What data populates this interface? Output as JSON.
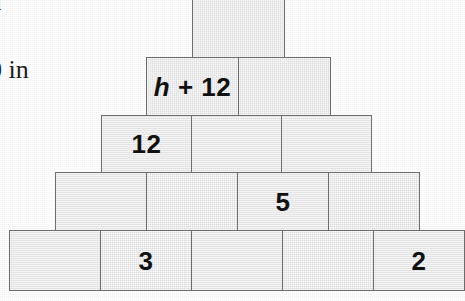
{
  "figure": {
    "type": "block-pyramid-diagram",
    "colors": {
      "block_fill": "#e9e9e9",
      "block_border": "#6f6f6f",
      "label_text": "#111111",
      "page_background": "#ffffff",
      "margin_text": "#1c1c1c"
    },
    "margin_text": {
      "top_fragment": "n",
      "units_fragment": "0 in"
    },
    "rows": [
      {
        "row": 1,
        "block_count": 1,
        "blocks": [
          {
            "index": 1,
            "label": "",
            "label_parts": []
          }
        ]
      },
      {
        "row": 2,
        "block_count": 2,
        "blocks": [
          {
            "index": 1,
            "label": "h + 12",
            "label_parts": [
              {
                "text": "h",
                "style": "italic"
              },
              {
                "text": " + 12",
                "style": "normal"
              }
            ]
          },
          {
            "index": 2,
            "label": "",
            "label_parts": []
          }
        ]
      },
      {
        "row": 3,
        "block_count": 3,
        "blocks": [
          {
            "index": 1,
            "label": "12",
            "label_parts": [
              {
                "text": "12",
                "style": "normal"
              }
            ]
          },
          {
            "index": 2,
            "label": "",
            "label_parts": []
          },
          {
            "index": 3,
            "label": "",
            "label_parts": []
          }
        ]
      },
      {
        "row": 4,
        "block_count": 4,
        "blocks": [
          {
            "index": 1,
            "label": "",
            "label_parts": []
          },
          {
            "index": 2,
            "label": "",
            "label_parts": []
          },
          {
            "index": 3,
            "label": "5",
            "label_parts": [
              {
                "text": "5",
                "style": "normal"
              }
            ]
          },
          {
            "index": 4,
            "label": "",
            "label_parts": []
          }
        ]
      },
      {
        "row": 5,
        "block_count": 5,
        "blocks": [
          {
            "index": 1,
            "label": "",
            "label_parts": []
          },
          {
            "index": 2,
            "label": "3",
            "label_parts": [
              {
                "text": "3",
                "style": "normal"
              }
            ]
          },
          {
            "index": 3,
            "label": "",
            "label_parts": []
          },
          {
            "index": 4,
            "label": "",
            "label_parts": []
          },
          {
            "index": 5,
            "label": "2",
            "label_parts": [
              {
                "text": "2",
                "style": "normal"
              }
            ]
          }
        ]
      }
    ]
  }
}
